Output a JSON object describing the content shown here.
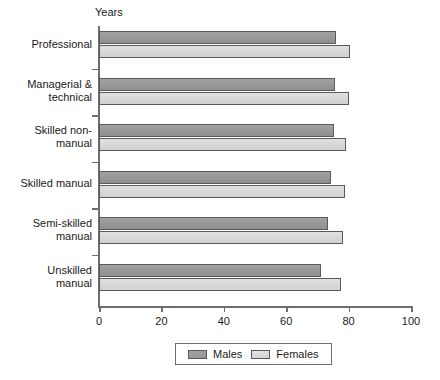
{
  "chart_data": {
    "type": "bar",
    "orientation": "horizontal",
    "title": "",
    "subtitle": "",
    "xlabel": "",
    "ylabel": "",
    "axis_unit_label": "Years",
    "categories": [
      "Professional",
      "Managerial & technical",
      "Skilled non-manual",
      "Skilled manual",
      "Semi-skilled manual",
      "Unskilled manual"
    ],
    "category_label_lines": [
      [
        "Professional"
      ],
      [
        "Managerial &",
        "technical"
      ],
      [
        "Skilled non-",
        "manual"
      ],
      [
        "Skilled manual"
      ],
      [
        "Semi-skilled",
        "manual"
      ],
      [
        "Unskilled",
        "manual"
      ]
    ],
    "series": [
      {
        "name": "Males",
        "color": "#999999",
        "values": [
          76.0,
          75.5,
          75.3,
          74.4,
          73.3,
          71.0
        ]
      },
      {
        "name": "Females",
        "color": "#d8d8d8",
        "values": [
          80.5,
          80.0,
          79.2,
          78.8,
          78.2,
          77.5
        ]
      }
    ],
    "xlim": [
      0,
      100
    ],
    "xticks": [
      0,
      20,
      40,
      60,
      80,
      100
    ],
    "xtick_labels": [
      "0",
      "20",
      "40",
      "60",
      "80",
      "100"
    ],
    "grid": false,
    "legend": {
      "position": "bottom-center",
      "entries": [
        {
          "label": "Males",
          "color": "#999999"
        },
        {
          "label": "Females",
          "color": "#d8d8d8"
        }
      ]
    }
  }
}
